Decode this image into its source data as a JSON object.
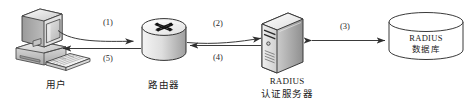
{
  "diagram": {
    "type": "network-authentication-flow",
    "background_color": "#ffffff",
    "line_color": "#3a3a3a",
    "nodes": [
      {
        "id": "user",
        "icon": "desktop-computer-icon",
        "label_lines": [
          "用户"
        ],
        "label_scripts": [
          "cn"
        ]
      },
      {
        "id": "router",
        "icon": "router-icon",
        "label_lines": [
          "路由器"
        ],
        "label_scripts": [
          "cn"
        ]
      },
      {
        "id": "radius-server",
        "icon": "server-tower-icon",
        "label_lines": [
          "RADIUS",
          "认证服务器"
        ],
        "label_scripts": [
          "en",
          "cn"
        ]
      },
      {
        "id": "radius-database",
        "icon": "database-cylinder-icon",
        "inner_lines": [
          "RADIUS",
          "数据库"
        ],
        "inner_scripts": [
          "en",
          "cn"
        ],
        "label_lines": [],
        "label_scripts": []
      }
    ],
    "edges": [
      {
        "id": "edge-1",
        "label": "(1)",
        "from": "user",
        "to": "router",
        "direction": "right"
      },
      {
        "id": "edge-5",
        "label": "(5)",
        "from": "router",
        "to": "user",
        "direction": "left"
      },
      {
        "id": "edge-2",
        "label": "(2)",
        "from": "router",
        "to": "radius-server",
        "direction": "right"
      },
      {
        "id": "edge-4",
        "label": "(4)",
        "from": "radius-server",
        "to": "router",
        "direction": "left"
      },
      {
        "id": "edge-3",
        "label": "(3)",
        "from": "radius-server",
        "to": "radius-database",
        "direction": "both"
      }
    ]
  }
}
